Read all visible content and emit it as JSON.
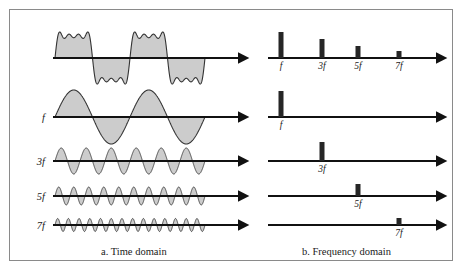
{
  "figure": {
    "frame": {
      "border_color": "#8a8a8a"
    },
    "captions": {
      "time_domain": "a. Time domain",
      "frequency_domain": "b. Frequency domain"
    },
    "colors": {
      "wave_fill": "#cccccc",
      "wave_stroke": "#333333",
      "axis": "#111111",
      "bar": "#262626",
      "text": "#1a1a1a"
    }
  },
  "chart_data": {
    "type": "line",
    "title": "",
    "subtitle": "",
    "xlabel": "",
    "ylabel": "",
    "legend_position": "left-labels",
    "grid": false,
    "panels": [
      {
        "id": "time-domain",
        "caption": "a. Time domain",
        "xlabel": "time",
        "ylabel": "amplitude",
        "axis_x0": 55,
        "axis_x1": 245,
        "wave_x0": 55,
        "wave_x1": 205,
        "rows": [
          {
            "label": "",
            "name": "composite-square-wave",
            "kind": "composite",
            "harmonics": [
              1,
              3,
              5,
              7
            ],
            "cycles": 2,
            "amplitude": 22,
            "baseline_y": 58
          },
          {
            "label": "f",
            "name": "fundamental-sine",
            "kind": "sine",
            "harmonic": 1,
            "cycles": 2,
            "amplitude": 27,
            "baseline_y": 117
          },
          {
            "label": "3f",
            "name": "third-harmonic-sine",
            "kind": "sine",
            "harmonic": 3,
            "cycles": 6,
            "amplitude": 13,
            "baseline_y": 161
          },
          {
            "label": "5f",
            "name": "fifth-harmonic-sine",
            "kind": "sine",
            "harmonic": 5,
            "cycles": 10,
            "amplitude": 9,
            "baseline_y": 196
          },
          {
            "label": "7f",
            "name": "seventh-harmonic-sine",
            "kind": "sine",
            "harmonic": 7,
            "cycles": 14,
            "amplitude": 6.5,
            "baseline_y": 225
          }
        ]
      },
      {
        "id": "frequency-domain",
        "caption": "b. Frequency domain",
        "xlabel": "frequency",
        "ylabel": "amplitude",
        "axis_x0": 268,
        "axis_x1": 443,
        "tick_positions": {
          "f": 281,
          "3f": 322,
          "5f": 358,
          "7f": 399
        },
        "rows": [
          {
            "name": "composite-spectrum",
            "baseline_y": 58,
            "bars": [
              {
                "label": "f",
                "x": 281,
                "height": 26,
                "width": 5
              },
              {
                "label": "3f",
                "x": 322,
                "height": 19,
                "width": 5
              },
              {
                "label": "5f",
                "x": 358,
                "height": 12,
                "width": 5
              },
              {
                "label": "7f",
                "x": 399,
                "height": 7,
                "width": 5
              }
            ],
            "show_tick_labels": true
          },
          {
            "name": "fundamental-spectrum",
            "baseline_y": 117,
            "bars": [
              {
                "label": "f",
                "x": 281,
                "height": 26,
                "width": 5
              }
            ],
            "show_tick_labels": true
          },
          {
            "name": "third-harmonic-spectrum",
            "baseline_y": 161,
            "bars": [
              {
                "label": "3f",
                "x": 322,
                "height": 19,
                "width": 5
              }
            ],
            "show_tick_labels": true
          },
          {
            "name": "fifth-harmonic-spectrum",
            "baseline_y": 196,
            "bars": [
              {
                "label": "5f",
                "x": 358,
                "height": 12,
                "width": 5
              }
            ],
            "show_tick_labels": true
          },
          {
            "name": "seventh-harmonic-spectrum",
            "baseline_y": 225,
            "bars": [
              {
                "label": "7f",
                "x": 399,
                "height": 7,
                "width": 5
              }
            ],
            "show_tick_labels": true
          }
        ]
      }
    ]
  }
}
